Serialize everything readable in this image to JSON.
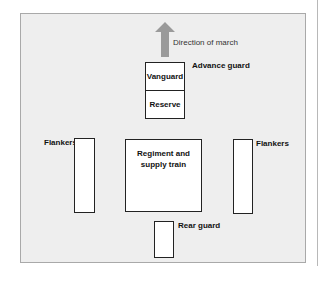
{
  "diagram": {
    "direction_label": "Direction of march",
    "advance_guard": {
      "label": "Advance guard",
      "cells": [
        "Vanguard",
        "Reserve"
      ]
    },
    "main_body": {
      "line1": "Regiment and",
      "line2": "supply train"
    },
    "flankers_left": {
      "label": "Flankers"
    },
    "flankers_right": {
      "label": "Flankers"
    },
    "rear_guard": {
      "label": "Rear guard"
    },
    "colors": {
      "panel_bg": "#eeeeee",
      "panel_border": "#a9a9a9",
      "arrow": "#9a9a9a",
      "box_fill": "#ffffff",
      "box_border": "#222222"
    }
  }
}
